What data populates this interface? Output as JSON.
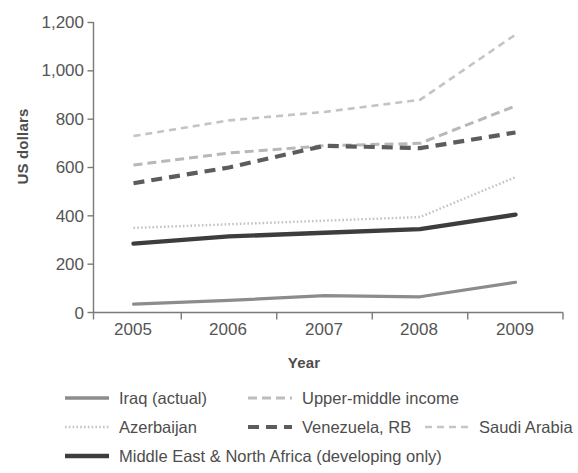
{
  "chart_data": {
    "type": "line",
    "title": "",
    "xlabel": "Year",
    "ylabel": "US dollars",
    "categories": [
      "2005",
      "2006",
      "2007",
      "2008",
      "2009"
    ],
    "ylim": [
      0,
      1200
    ],
    "yticks": [
      0,
      200,
      400,
      600,
      800,
      1000,
      1200
    ],
    "ytick_labels": [
      "0",
      "200",
      "400",
      "600",
      "800",
      "1,000",
      "1,200"
    ],
    "grid": false,
    "legend_position": "bottom",
    "series": [
      {
        "name": "Iraq (actual)",
        "values": [
          35,
          50,
          70,
          65,
          125
        ],
        "color": "#8c8c8c",
        "style": "solid",
        "width": 3.2,
        "dash": "none"
      },
      {
        "name": "Upper-middle income",
        "values": [
          610,
          660,
          690,
          700,
          855
        ],
        "color": "#b8b8b8",
        "style": "dashed",
        "width": 3.0,
        "dash": "9 5"
      },
      {
        "name": "Azerbaijan",
        "values": [
          350,
          365,
          380,
          395,
          560
        ],
        "color": "#c2c2c2",
        "style": "dotted",
        "width": 2.4,
        "dash": "1.6 2.2"
      },
      {
        "name": "Venezuela, RB",
        "values": [
          535,
          600,
          690,
          680,
          745
        ],
        "color": "#5c5c5c",
        "style": "dashed",
        "width": 4.2,
        "dash": "11 7"
      },
      {
        "name": "Saudi Arabia",
        "values": [
          730,
          795,
          830,
          880,
          1150
        ],
        "color": "#c4c4c4",
        "style": "dashed",
        "width": 2.6,
        "dash": "7 5"
      },
      {
        "name": "Middle East & North Africa (developing only)",
        "values": [
          285,
          315,
          330,
          345,
          405
        ],
        "color": "#3d3d3d",
        "style": "solid",
        "width": 4.4,
        "dash": "none"
      }
    ]
  },
  "axis": {
    "ylabel": "US dollars",
    "xlabel": "Year",
    "ytick_0": "0",
    "ytick_200": "200",
    "ytick_400": "400",
    "ytick_600": "600",
    "ytick_800": "800",
    "ytick_1000": "1,000",
    "ytick_1200": "1,200",
    "xtick_2005": "2005",
    "xtick_2006": "2006",
    "xtick_2007": "2007",
    "xtick_2008": "2008",
    "xtick_2009": "2009",
    "axis_color": "#7a7a7a"
  },
  "legend": {
    "entries": [
      {
        "label": "Iraq (actual)",
        "row": 0,
        "col": 0
      },
      {
        "label": "Upper-middle income",
        "row": 0,
        "col": 1
      },
      {
        "label": "Azerbaijan",
        "row": 1,
        "col": 0
      },
      {
        "label": "Venezuela, RB",
        "row": 1,
        "col": 1
      },
      {
        "label": "Saudi Arabia",
        "row": 1,
        "col": 2
      },
      {
        "label": "Middle East & North Africa (developing only)",
        "row": 2,
        "col": 0
      }
    ]
  }
}
